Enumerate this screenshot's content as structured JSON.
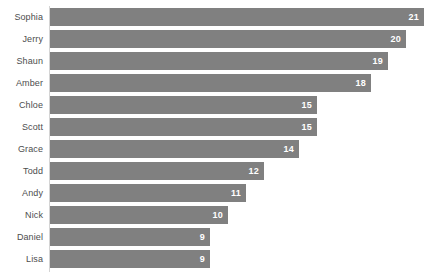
{
  "chart_data": {
    "type": "bar",
    "orientation": "horizontal",
    "title": "",
    "subtitle": "",
    "xlabel": "",
    "ylabel": "",
    "categories": [
      "Sophia",
      "Jerry",
      "Shaun",
      "Amber",
      "Chloe",
      "Scott",
      "Grace",
      "Todd",
      "Andy",
      "Nick",
      "Daniel",
      "Lisa"
    ],
    "values": [
      21,
      20,
      19,
      18,
      15,
      15,
      14,
      12,
      11,
      10,
      9,
      9
    ],
    "xlim": [
      0,
      21
    ],
    "grid": false,
    "legend": null,
    "data_labels": [
      "21",
      "20",
      "19",
      "18",
      "15",
      "15",
      "14",
      "12",
      "11",
      "10",
      "9",
      "9"
    ],
    "bar_color": "#808080",
    "data_label_color": "#ffffff",
    "category_label_color": "#4d4d4d",
    "axis_line_color": "#d4d4d4",
    "background_color": "#ffffff"
  }
}
